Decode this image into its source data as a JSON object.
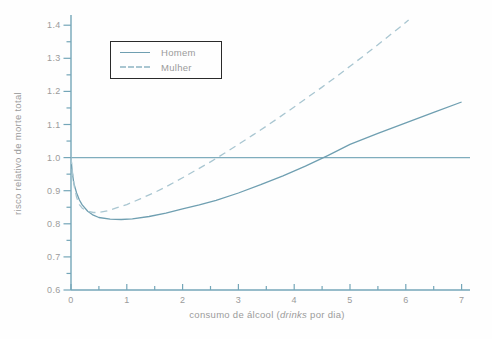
{
  "figure": {
    "ylabel": "risco relativo de morte total",
    "xlabel_prefix": "consumo de álcool (",
    "xlabel_italic": "drinks",
    "xlabel_suffix": " por dia)"
  },
  "legend": {
    "items": [
      {
        "label": "Homem",
        "style": "solid"
      },
      {
        "label": "Mulher",
        "style": "dashed"
      }
    ]
  },
  "chart_data": {
    "type": "line",
    "title": "",
    "xlabel": "consumo de álcool (drinks por dia)",
    "ylabel": "risco relativo de morte total",
    "xlim": [
      0,
      7
    ],
    "ylim": [
      0.6,
      1.4
    ],
    "xtick_major_step": 1,
    "xtick_minor_step": 0.5,
    "ytick_major_step": 0.1,
    "ytick_minor_step": 0.05,
    "reference_line_y": 1.0,
    "grid": false,
    "legend_position": "upper-left-inside",
    "colors": {
      "axis": "#74a6b8",
      "reference_line": "#7fadbd",
      "tick_text": "#9b9b9b",
      "homem_line": "#6f9fb1",
      "mulher_line": "#a9c6d1",
      "legend_border": "#2a2a2a"
    },
    "series": [
      {
        "name": "Homem",
        "dash": false,
        "color": "#6f9fb1",
        "points": [
          [
            0,
            1.001
          ],
          [
            0.02,
            0.96
          ],
          [
            0.05,
            0.923
          ],
          [
            0.1,
            0.893
          ],
          [
            0.15,
            0.872
          ],
          [
            0.2,
            0.857
          ],
          [
            0.3,
            0.838
          ],
          [
            0.4,
            0.826
          ],
          [
            0.5,
            0.819
          ],
          [
            0.7,
            0.814
          ],
          [
            0.9,
            0.813
          ],
          [
            1.1,
            0.815
          ],
          [
            1.4,
            0.822
          ],
          [
            1.7,
            0.832
          ],
          [
            2.0,
            0.845
          ],
          [
            2.3,
            0.857
          ],
          [
            2.6,
            0.871
          ],
          [
            3.0,
            0.893
          ],
          [
            3.4,
            0.918
          ],
          [
            3.8,
            0.945
          ],
          [
            4.2,
            0.974
          ],
          [
            4.6,
            1.006
          ],
          [
            5.0,
            1.04
          ],
          [
            5.5,
            1.073
          ],
          [
            6.0,
            1.105
          ],
          [
            6.5,
            1.137
          ],
          [
            7.0,
            1.168
          ]
        ]
      },
      {
        "name": "Mulher",
        "dash": true,
        "color": "#a9c6d1",
        "points": [
          [
            0,
            1.001
          ],
          [
            0.03,
            0.95
          ],
          [
            0.06,
            0.912
          ],
          [
            0.1,
            0.88
          ],
          [
            0.15,
            0.858
          ],
          [
            0.2,
            0.847
          ],
          [
            0.3,
            0.838
          ],
          [
            0.4,
            0.834
          ],
          [
            0.5,
            0.834
          ],
          [
            0.65,
            0.839
          ],
          [
            0.8,
            0.847
          ],
          [
            1.0,
            0.858
          ],
          [
            1.25,
            0.876
          ],
          [
            1.5,
            0.895
          ],
          [
            1.75,
            0.916
          ],
          [
            2.0,
            0.939
          ],
          [
            2.25,
            0.963
          ],
          [
            2.5,
            0.987
          ],
          [
            2.75,
            1.013
          ],
          [
            3.0,
            1.04
          ],
          [
            3.25,
            1.067
          ],
          [
            3.5,
            1.095
          ],
          [
            3.75,
            1.124
          ],
          [
            4.0,
            1.153
          ],
          [
            4.25,
            1.183
          ],
          [
            4.5,
            1.213
          ],
          [
            4.75,
            1.244
          ],
          [
            5.0,
            1.276
          ],
          [
            5.25,
            1.308
          ],
          [
            5.5,
            1.341
          ],
          [
            5.7,
            1.368
          ],
          [
            5.9,
            1.395
          ],
          [
            6.05,
            1.416
          ]
        ]
      }
    ]
  }
}
